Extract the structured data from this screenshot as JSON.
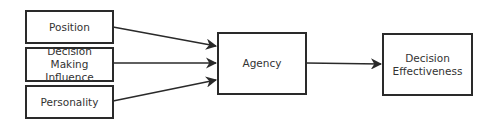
{
  "diagram": {
    "nodes": [
      {
        "id": "position",
        "label": "Position"
      },
      {
        "id": "decision_making_influence",
        "label_lines": [
          "Decision Making",
          "Influence"
        ]
      },
      {
        "id": "personality",
        "label": "Personality"
      },
      {
        "id": "agency",
        "label": "Agency"
      },
      {
        "id": "decision_effectiveness",
        "label_lines": [
          "Decision",
          "Effectiveness"
        ]
      }
    ],
    "edges": [
      {
        "from": "position",
        "to": "agency"
      },
      {
        "from": "decision_making_influence",
        "to": "agency"
      },
      {
        "from": "personality",
        "to": "agency"
      },
      {
        "from": "agency",
        "to": "decision_effectiveness"
      }
    ],
    "colors": {
      "stroke": "#2a2a2a",
      "text": "#333333",
      "background": "#ffffff"
    }
  }
}
